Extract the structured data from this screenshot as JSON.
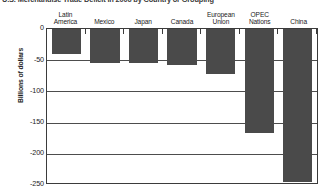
{
  "chart_data": {
    "type": "bar",
    "title": "U.S. Merchandise Trade Deficit in 2006 by Country or Grouping",
    "xlabel": "",
    "ylabel": "Billions of dollars",
    "categories": [
      "Latin\nAmerica",
      "Mexico",
      "Japan",
      "Canada",
      "European\nUnion",
      "OPEC\nNations",
      "China"
    ],
    "values": [
      -40,
      -55,
      -55,
      -57,
      -72,
      -166,
      -245
    ],
    "ylim": [
      -250,
      0
    ],
    "yticks": [
      0,
      -50,
      -100,
      -150,
      -200,
      -250
    ],
    "ytick_labels": [
      "0",
      "-50",
      "-100",
      "-150",
      "-200",
      "-250"
    ],
    "grid": true,
    "legend": "none",
    "bar_color": "#4a4a4a",
    "axis_color": "#3b3b3b",
    "background_color": "#ffffff"
  }
}
